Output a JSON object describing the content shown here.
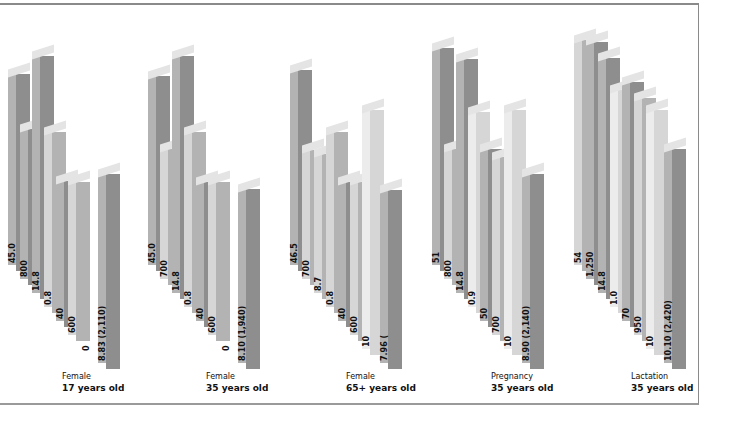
{
  "chart_data": {
    "type": "bar",
    "style": "3d-isometric-grouped",
    "title": "",
    "xlabel": "",
    "ylabel": "",
    "grid": false,
    "legend": "none",
    "groups": [
      {
        "category": "Female",
        "age": "17 years old",
        "labels": [
          "45.0",
          "800",
          "14.8",
          "0.8",
          "40",
          "600",
          "0",
          "8.83 (2,110)"
        ]
      },
      {
        "category": "Female",
        "age": "35 years old",
        "labels": [
          "45.0",
          "700",
          "14.8",
          "0.8",
          "40",
          "600",
          "0",
          "8.10 (1,940)"
        ]
      },
      {
        "category": "Female",
        "age": "65+ years old",
        "labels": [
          "46.5",
          "700",
          "8.7",
          "0.8",
          "40",
          "600",
          "10",
          "7.96 ("
        ]
      },
      {
        "category": "Pregnancy",
        "age": "35 years old",
        "labels": [
          "51",
          "800",
          "14.8",
          "0.9",
          "50",
          "700",
          "10",
          "8.90 (2,140)"
        ]
      },
      {
        "category": "Lactation",
        "age": "35 years old",
        "labels": [
          "54",
          "1,250",
          "14.8",
          "1.0",
          "70",
          "950",
          "10",
          "10.10 (2,420)"
        ]
      }
    ],
    "colors": {
      "light": "#d6d6d6",
      "mid": "#b3b3b3",
      "dark": "#8e8e8e",
      "white": "#ececec"
    }
  },
  "captions": [
    {
      "category": "Female",
      "age": "17 years old"
    },
    {
      "category": "Female",
      "age": "35 years old"
    },
    {
      "category": "Female",
      "age": "65+ years old"
    },
    {
      "category": "Pregnancy",
      "age": "35 years old"
    },
    {
      "category": "Lactation",
      "age": "35 years old"
    }
  ]
}
